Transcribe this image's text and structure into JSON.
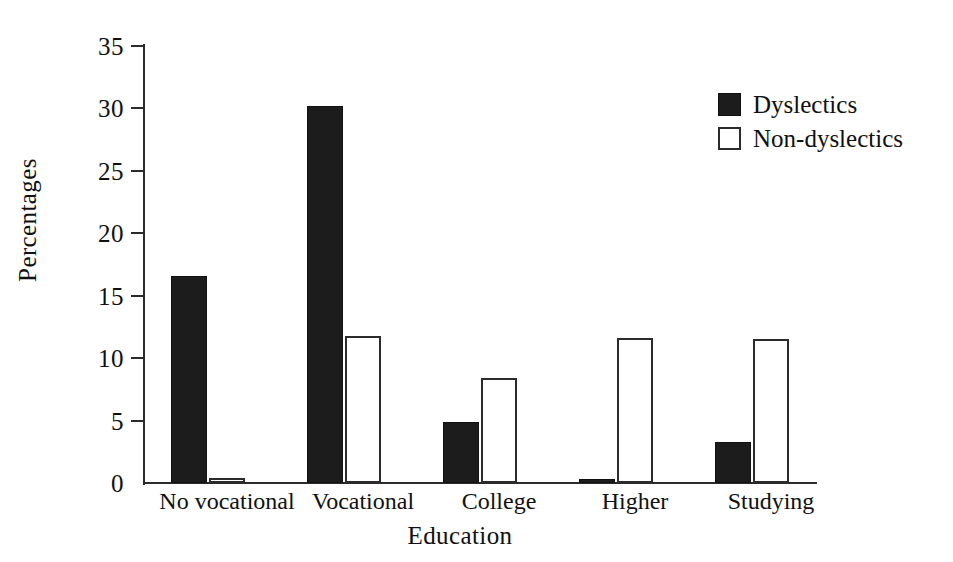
{
  "chart_data": {
    "type": "bar",
    "title": "",
    "xlabel": "Education",
    "ylabel": "Percentages",
    "categories": [
      "No vocational",
      "Vocational",
      "College",
      "Higher",
      "Studying"
    ],
    "series": [
      {
        "name": "Dyslectics",
        "values": [
          16.6,
          30.2,
          4.9,
          0.3,
          3.3
        ],
        "color": "#1c1c1c",
        "fill": "solid-black"
      },
      {
        "name": "Non-dyslectics",
        "values": [
          0.4,
          11.8,
          8.4,
          11.6,
          11.5
        ],
        "color": "#ffffff",
        "fill": "white-outline"
      }
    ],
    "ylim": [
      0,
      35
    ],
    "yticks": [
      0,
      5,
      10,
      15,
      20,
      25,
      30,
      35
    ],
    "ytick_labels": [
      "0",
      "5",
      "10",
      "15",
      "20",
      "25",
      "30",
      "35"
    ],
    "grid": false,
    "legend_position": "top-right",
    "legend_entries": [
      "Dyslectics",
      "Non-dyslectics"
    ]
  },
  "axis": {
    "y_title": "Percentages",
    "x_title": "Education"
  }
}
